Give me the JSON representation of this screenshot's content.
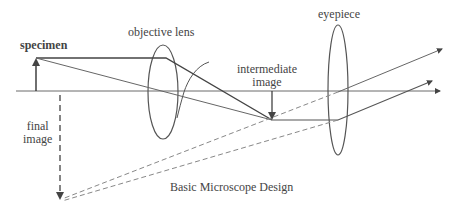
{
  "labels": {
    "specimen": "specimen",
    "objective_lens": "objective lens",
    "intermediate_image_line1": "intermediate",
    "intermediate_image_line2": "image",
    "eyepiece": "eyepiece",
    "final_image_line1": "final",
    "final_image_line2": "image",
    "caption": "Basic Microscope Design"
  },
  "colors": {
    "line": "#555555",
    "text": "#444444",
    "background": "#ffffff"
  },
  "elements": {
    "optical_axis": {
      "x1": 16,
      "y": 91,
      "x2": 443
    },
    "specimen_arrow": {
      "x": 36,
      "y_base": 91,
      "y_tip": 58
    },
    "objective_lens": {
      "cx": 163,
      "cy": 92,
      "rx": 15,
      "ry": 47
    },
    "intermediate_image_arrow": {
      "x": 272,
      "y_base": 91,
      "y_tip": 120
    },
    "eyepiece": {
      "cx": 338,
      "cy": 90,
      "rx": 10,
      "ry": 65
    },
    "final_image_arrow": {
      "x": 60,
      "y_base": 95,
      "y_tip": 200
    }
  }
}
